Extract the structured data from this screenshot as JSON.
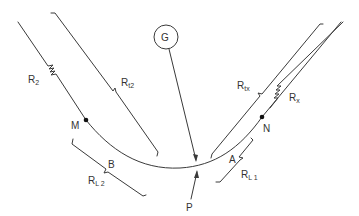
{
  "diagram": {
    "type": "circuit-schematic",
    "galvanometer": {
      "label": "G"
    },
    "probe": {
      "label": "P"
    },
    "nodes": {
      "m": "M",
      "n": "N"
    },
    "segments": {
      "a": "A",
      "b": "B"
    },
    "resistors": {
      "r2": {
        "main": "R",
        "sub": "2"
      },
      "rt2": {
        "main": "R",
        "sub": "t2"
      },
      "rtx": {
        "main": "R",
        "sub": "tx"
      },
      "rx": {
        "main": "R",
        "sub": "x"
      },
      "rl1": {
        "main": "R",
        "sub": "L 1"
      },
      "rl2": {
        "main": "R",
        "sub": "L 2"
      }
    },
    "colors": {
      "line": "#3a3a3a",
      "text": "#333333",
      "background": "#ffffff"
    }
  }
}
